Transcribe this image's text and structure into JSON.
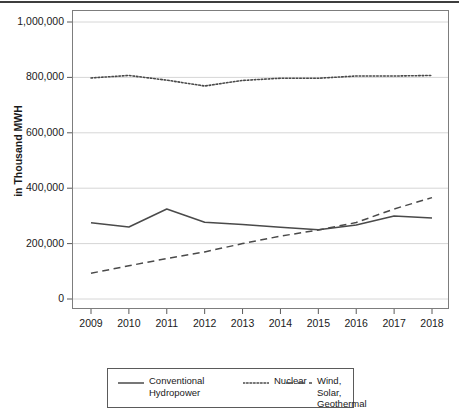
{
  "chart_data": {
    "type": "line",
    "title": "",
    "xlabel": "",
    "ylabel": "in Thousand MWH",
    "categories": [
      "2009",
      "2010",
      "2011",
      "2012",
      "2013",
      "2014",
      "2015",
      "2016",
      "2017",
      "2018"
    ],
    "x": [
      2009,
      2010,
      2011,
      2012,
      2013,
      2014,
      2015,
      2016,
      2017,
      2018
    ],
    "ylim": [
      0,
      1000000
    ],
    "y_ticks": [
      0,
      200000,
      400000,
      600000,
      800000,
      1000000
    ],
    "y_tick_labels": [
      "0",
      "200,000",
      "400,000",
      "600,000",
      "800,000",
      "1,000,000"
    ],
    "grid": "horizontal",
    "legend_position": "bottom",
    "series": [
      {
        "name": "Conventional Hydropower",
        "style": "solid",
        "color": "#4a4a4a",
        "values": [
          275000,
          260000,
          325000,
          277000,
          269000,
          259000,
          250000,
          267000,
          300000,
          292000
        ]
      },
      {
        "name": "Nuclear",
        "style": "dotted",
        "color": "#4a4a4a",
        "values": [
          798000,
          807000,
          790000,
          769000,
          789000,
          797000,
          797000,
          805000,
          805000,
          807000
        ]
      },
      {
        "name": "Wind, Solar, Geothermal",
        "style": "dashed",
        "color": "#4a4a4a",
        "values": [
          93000,
          120000,
          146000,
          170000,
          200000,
          227000,
          249000,
          276000,
          325000,
          366000
        ]
      }
    ]
  },
  "legend": {
    "items": [
      {
        "label": "Conventional\nHydropower",
        "style": "solid"
      },
      {
        "label": "Nuclear",
        "style": "dotted"
      },
      {
        "label": "Wind, Solar,\nGeothermal",
        "style": "dashed"
      }
    ]
  },
  "axis": {
    "y_title": "in Thousand MWH"
  }
}
